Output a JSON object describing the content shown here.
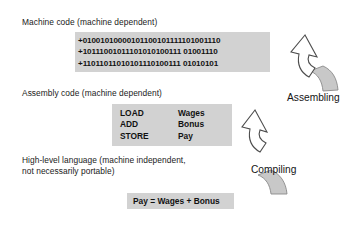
{
  "diagram": {
    "title_levels": {
      "machine": "Machine code (machine dependent)",
      "assembly": "Assembly code (machine dependent)",
      "hll_line1": "High-level language (machine independent,",
      "hll_line2": "not necessarily portable)"
    },
    "machine_code": {
      "lines": [
        "+01001010000101100101111101001110",
        "+10111001011101010100111 01001110",
        "+11011011010101110100111 01010101"
      ]
    },
    "assembly_code": {
      "rows": [
        {
          "op": "LOAD",
          "arg": "Wages"
        },
        {
          "op": "ADD",
          "arg": "Bonus"
        },
        {
          "op": "STORE",
          "arg": "Pay"
        }
      ]
    },
    "high_level_code": {
      "expression": "Pay = Wages + Bonus"
    },
    "processes": [
      {
        "label": "Assembling"
      },
      {
        "label": "Compiling"
      }
    ],
    "colors": {
      "code_block_bg": "#d2d2d2",
      "arrow_tail_fill": "#c8c8c8",
      "arrow_outline_stroke": "#4d4d4d",
      "text": "#1a1a1a",
      "page_bg": "#ffffff"
    }
  }
}
